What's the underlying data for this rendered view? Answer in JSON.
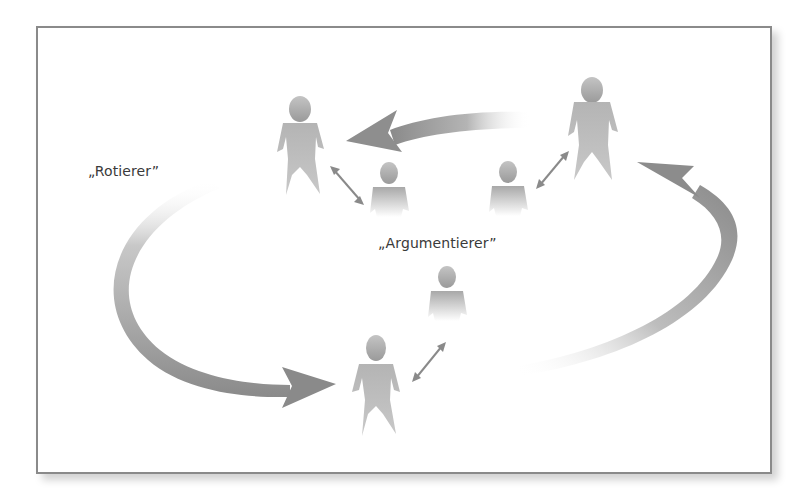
{
  "diagram": {
    "labels": {
      "rotierer": "„Rotierer”",
      "argumentierer": "„Argumentierer”"
    },
    "nodes": [
      {
        "id": "person-top-left",
        "size": "large",
        "group": "rotierer"
      },
      {
        "id": "person-top-right",
        "size": "large",
        "group": "rotierer"
      },
      {
        "id": "person-bottom-center",
        "size": "large",
        "group": "rotierer"
      },
      {
        "id": "person-small-left",
        "size": "small",
        "group": "argumentierer"
      },
      {
        "id": "person-small-right",
        "size": "small",
        "group": "argumentierer"
      },
      {
        "id": "person-small-bottom",
        "size": "small",
        "group": "argumentierer"
      }
    ],
    "edges": [
      {
        "from": "person-top-right",
        "to": "person-top-left",
        "type": "curved-arrow"
      },
      {
        "from": "person-top-left",
        "to": "person-bottom-center",
        "type": "curved-arrow",
        "route": "left loop"
      },
      {
        "from": "person-bottom-center",
        "to": "person-top-right",
        "type": "curved-arrow",
        "route": "right loop"
      },
      {
        "from": "person-top-left",
        "to": "person-small-left",
        "type": "double-arrow"
      },
      {
        "from": "person-top-right",
        "to": "person-small-right",
        "type": "double-arrow"
      },
      {
        "from": "person-bottom-center",
        "to": "person-small-bottom",
        "type": "double-arrow"
      }
    ],
    "colors": {
      "frame": "#8a8a8a",
      "arrow": "#8c8c8c",
      "person": "#a8a8a8",
      "text": "#3a3a3a"
    }
  }
}
